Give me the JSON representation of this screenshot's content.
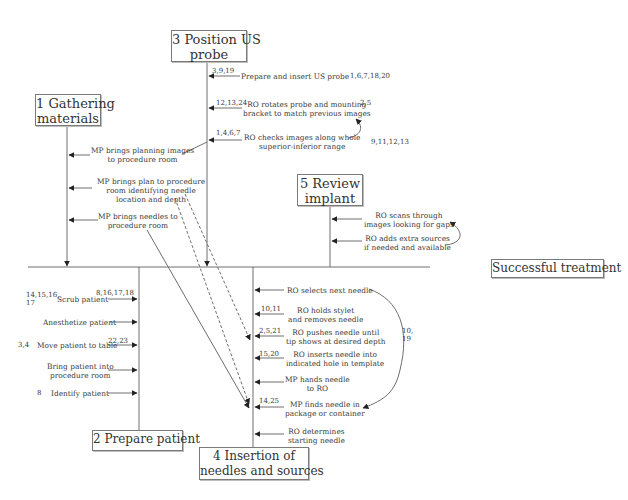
{
  "colors": {
    "line": "#6e6e6e",
    "text": "#3a3a3a",
    "box_border": "#7a7a7a",
    "background": "#ffffff"
  },
  "boxes": {
    "gathering": {
      "line1": "1 Gathering",
      "line2": "materials"
    },
    "prepare": {
      "line1": "2 Prepare patient"
    },
    "position": {
      "line1": "3 Position US",
      "line2": "probe"
    },
    "insertion": {
      "line1": "4 Insertion of",
      "line2": "needles and sources"
    },
    "review": {
      "line1": "5 Review",
      "line2": "implant"
    },
    "success": {
      "line1": "Successful treatment"
    }
  },
  "gathering_steps": [
    {
      "line1": "MP brings planning images",
      "line2": "to procedure room"
    },
    {
      "line1": "MP brings plan to procedure",
      "line2": "room identifying needle",
      "line3": "location and depth"
    },
    {
      "line1": "MP brings needles to",
      "line2": "procedure room"
    }
  ],
  "position_steps": [
    {
      "line1": "Prepare and insert US probe",
      "left_num": "3,9,19",
      "right_num": "1,6,7,18,20"
    },
    {
      "line1": "RO rotates probe and mounting",
      "line2": "bracket to match previous images",
      "left_num": "12,13,24",
      "right_num": "2,5"
    },
    {
      "line1": "RO checks images along whole",
      "line2": "superior-inferior range",
      "left_num": "1,4,6,7",
      "right_num": "9,11,12,13"
    }
  ],
  "review_steps": [
    {
      "line1": "RO scans through",
      "line2": "images looking for gaps"
    },
    {
      "line1": "RO adds extra sources",
      "line2": "if needed and available"
    }
  ],
  "prepare_steps": [
    {
      "line1": "Scrub patient",
      "left_num_a": "14,15,16,",
      "left_num_b": "17",
      "right_num": "8,16,17,18"
    },
    {
      "line1": "Anesthetize patient"
    },
    {
      "line1": "Move patient to table",
      "left_num": "3,4",
      "right_num": "22,23"
    },
    {
      "line1": "Bring patient into",
      "line2": "procedure room"
    },
    {
      "line1": "Identify patient",
      "left_num": "8"
    }
  ],
  "insertion_steps": [
    {
      "line1": "RO selects next needle"
    },
    {
      "line1": "RO holds stylet",
      "line2": "and removes needle",
      "left_num": "10,11"
    },
    {
      "line1": "RO pushes needle until",
      "line2": "tip shows at desired depth",
      "left_num": "2,5,21"
    },
    {
      "line1": "RO inserts needle into",
      "line2": "indicated hole in template",
      "left_num": "15,20"
    },
    {
      "line1": "MP hands needle",
      "line2": "to RO"
    },
    {
      "line1": "MP finds needle in",
      "line2": "package or container",
      "left_num": "14,25"
    },
    {
      "line1": "RO determines",
      "line2": "starting needle"
    }
  ],
  "loop_label": {
    "line1": "10,",
    "line2": "19"
  }
}
